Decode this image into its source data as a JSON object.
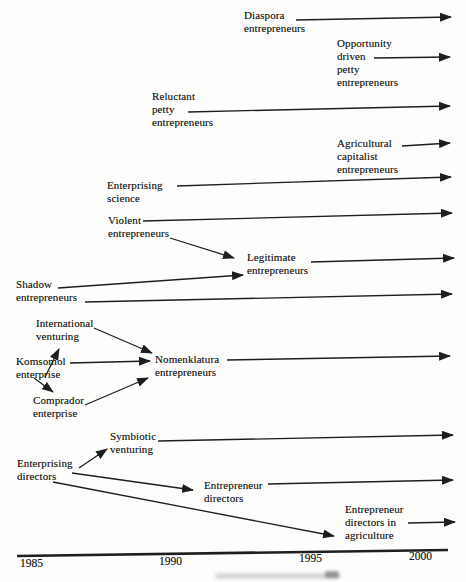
{
  "figure": {
    "colors": {
      "ink": "#1e1e1e",
      "paper": "#fdfdfb"
    },
    "labels": [
      {
        "id": "diaspora-entrepreneurs",
        "text": "Diaspora\nentrepreneurs"
      },
      {
        "id": "opportunity-driven-petty-entrepreneurs",
        "text": "Opportunity\ndriven\npetty\nentrepreneurs"
      },
      {
        "id": "reluctant-petty-entrepreneurs",
        "text": "Reluctant\npetty\nentrepreneurs"
      },
      {
        "id": "agricultural-capitalist-entrepreneurs",
        "text": "Agricultural\ncapitalist\nentrepreneurs"
      },
      {
        "id": "enterprising-science",
        "text": "Enterprising\nscience"
      },
      {
        "id": "violent-entrepreneurs",
        "text": "Violent\nentrepreneurs"
      },
      {
        "id": "legitimate-entrepreneurs",
        "text": "Legitimate\nentrepreneurs"
      },
      {
        "id": "shadow-entrepreneurs",
        "text": "Shadow\nentrepreneurs"
      },
      {
        "id": "international-venturing",
        "text": "International\nventuring"
      },
      {
        "id": "komsomol-enterprise",
        "text": "Komsomol\nenterprise"
      },
      {
        "id": "comprador-enterprise",
        "text": "Comprador\nenterprise"
      },
      {
        "id": "nomenklatura-entrepreneurs",
        "text": "Nomenklatura\nentrepreneurs"
      },
      {
        "id": "symbiotic-venturing",
        "text": "Symbiotic\nventuring"
      },
      {
        "id": "enterprising-directors",
        "text": "Enterprising\ndirectors"
      },
      {
        "id": "entrepreneur-directors",
        "text": "Entrepreneur\ndirectors"
      },
      {
        "id": "entrepreneur-directors-in-agriculture",
        "text": "Entrepreneur\ndirectors in\nagriculture"
      }
    ],
    "timeline": {
      "years": [
        "1985",
        "1990",
        "1995",
        "2000"
      ]
    }
  }
}
